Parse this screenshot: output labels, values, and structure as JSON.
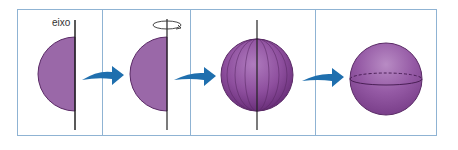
{
  "diagram": {
    "axis_label": "eixo",
    "panels": [
      {
        "id": 1,
        "content": "semicircle-with-axis"
      },
      {
        "id": 2,
        "content": "semicircle-rotating-about-axis"
      },
      {
        "id": 3,
        "content": "sphere-with-meridians-and-axis"
      },
      {
        "id": 4,
        "content": "sphere-with-equator"
      }
    ],
    "colors": {
      "shape_fill": "#8e5a9c",
      "shape_stroke": "#5a2a66",
      "arrow": "#1f6fae",
      "border": "#8fb3d3",
      "axis": "#222222"
    }
  }
}
